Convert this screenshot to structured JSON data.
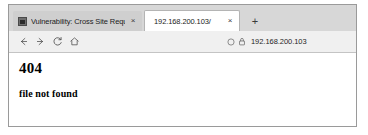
{
  "browser": {
    "tabs": [
      {
        "title": "Vulnerability: Cross Site Requ",
        "favicon": "page-favicon",
        "close_label": "×",
        "active": false
      },
      {
        "title": "192.168.200.103/",
        "close_label": "×",
        "active": true
      }
    ],
    "new_tab_label": "+",
    "toolbar": {
      "back_icon": "arrow-left-icon",
      "forward_icon": "arrow-right-icon",
      "reload_icon": "reload-icon",
      "home_icon": "home-icon",
      "shield_icon": "shield-icon",
      "lock_icon": "lock-icon",
      "url": "192.168.200.103"
    }
  },
  "page": {
    "error_code": "404",
    "error_message": "file not found"
  },
  "colors": {
    "tabstrip_bg": "#d7d7d7",
    "inactive_tab_bg": "#cfcfcf",
    "active_tab_bg": "#ffffff",
    "toolbar_bg": "#f0f0f0",
    "window_border": "#9a9a9a",
    "page_bg": "#ffffff",
    "text": "#000000"
  }
}
